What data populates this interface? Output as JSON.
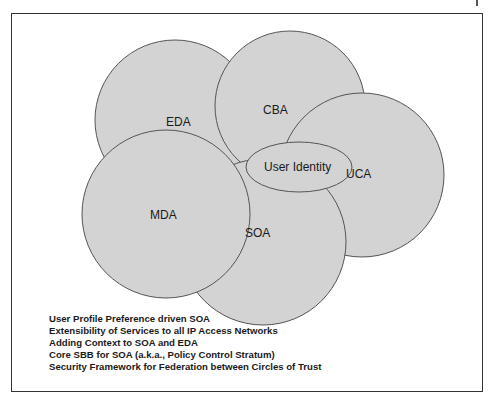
{
  "diagram": {
    "circles": [
      {
        "id": "eda",
        "label": "EDA"
      },
      {
        "id": "cba",
        "label": "CBA"
      },
      {
        "id": "uca",
        "label": "UCA"
      },
      {
        "id": "mda",
        "label": "MDA"
      },
      {
        "id": "soa",
        "label": "SOA"
      }
    ],
    "center_ellipse": {
      "label": "User Identity"
    },
    "fill_color": "#d3d3d3",
    "stroke_color": "#555555"
  },
  "notes": [
    "User Profile Preference driven SOA",
    "Extensibility of Services to all IP Access Networks",
    "Adding Context to SOA and EDA",
    "Core SBB for SOA (a.k.a., Policy Control Stratum)",
    "Security Framework for Federation between Circles of Trust"
  ]
}
